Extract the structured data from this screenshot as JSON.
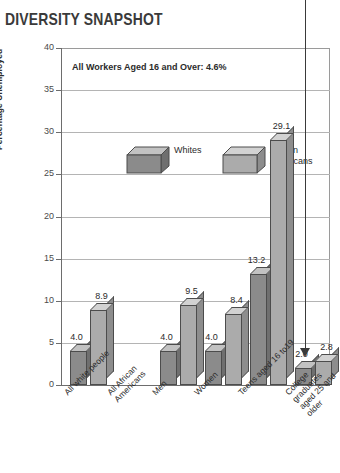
{
  "title": "DIVERSITY SNAPSHOT",
  "annotation": "All Workers Aged 16 and Over: 4.6%",
  "legend": {
    "items": [
      {
        "label": "Whites",
        "color": "#8b8b8b"
      },
      {
        "label": "African\nAmericans",
        "color": "#ababab"
      }
    ]
  },
  "arrow": {
    "name": "pointer-arrow",
    "target": "College graduates aged 25 and older"
  },
  "chart_data": {
    "type": "bar",
    "title": "DIVERSITY SNAPSHOT",
    "xlabel": "",
    "ylabel": "Percentage Unemployed",
    "ylim": [
      0,
      40
    ],
    "yticks": [
      0,
      5,
      10,
      15,
      20,
      25,
      30,
      35,
      40
    ],
    "ytick_labels": [
      "0",
      "5",
      "10",
      "15",
      "20",
      "25",
      "30",
      "35",
      "40"
    ],
    "grid": true,
    "legend_position": "upper-left-inside",
    "categories": [
      "All white people",
      "All African\nAmericans",
      "Men",
      "Women",
      "Teens aged 16 to19",
      "College graduates\naged 25 and older"
    ],
    "series": [
      {
        "name": "Whites",
        "color": "#8b8b8b",
        "values": [
          4.0,
          null,
          4.0,
          4.0,
          13.2,
          2.0
        ],
        "value_labels": [
          "4.0",
          "",
          "4.0",
          "4.0",
          "13.2",
          "2.0"
        ]
      },
      {
        "name": "African Americans",
        "color": "#ababab",
        "values": [
          8.9,
          null,
          9.5,
          8.4,
          29.1,
          2.8
        ],
        "value_labels": [
          "8.9",
          "",
          "9.5",
          "8.4",
          "29.1",
          "2.8"
        ]
      }
    ],
    "bars": [
      {
        "group": 0,
        "series": "Whites",
        "value": 4.0,
        "label": "4.0"
      },
      {
        "group": 0,
        "series": "African Americans",
        "value": 8.9,
        "label": "8.9"
      },
      {
        "group": 1,
        "series": "Whites",
        "value": 4.0,
        "label": "4.0"
      },
      {
        "group": 1,
        "series": "African Americans",
        "value": 9.5,
        "label": "9.5"
      },
      {
        "group": 2,
        "series": "Whites",
        "value": 4.0,
        "label": "4.0"
      },
      {
        "group": 2,
        "series": "African Americans",
        "value": 8.4,
        "label": "8.4"
      },
      {
        "group": 3,
        "series": "Whites",
        "value": 13.2,
        "label": "13.2"
      },
      {
        "group": 3,
        "series": "African Americans",
        "value": 29.1,
        "label": "29.1"
      },
      {
        "group": 4,
        "series": "Whites",
        "value": 2.0,
        "label": "2.0"
      },
      {
        "group": 4,
        "series": "African Americans",
        "value": 2.8,
        "label": "2.8"
      },
      {
        "group": 5,
        "series": "note",
        "value": 4.6,
        "label": "All Workers Aged 16 and Over: 4.6%"
      }
    ],
    "annotations": [
      "All Workers Aged 16 and Over: 4.6%"
    ]
  }
}
